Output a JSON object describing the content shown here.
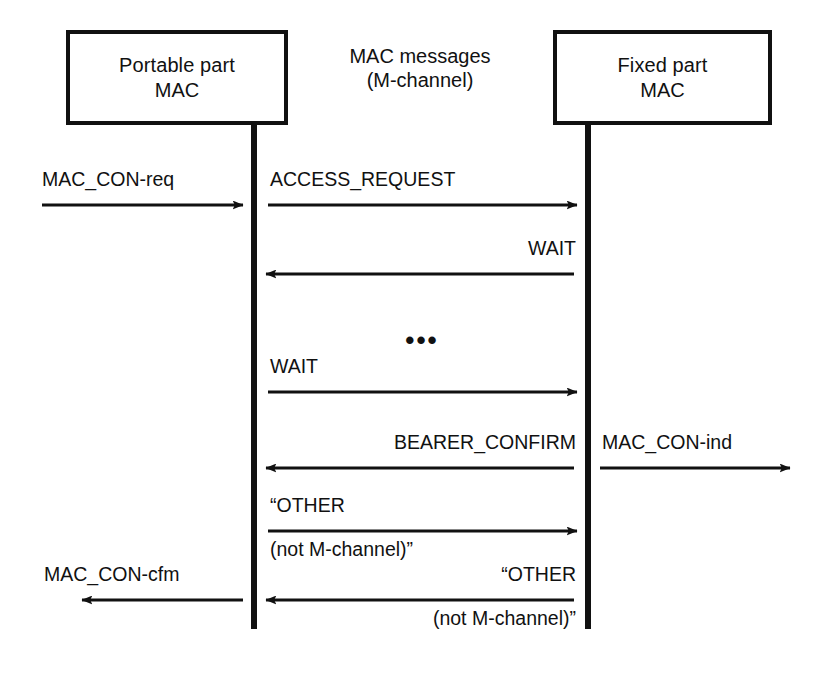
{
  "diagram": {
    "background_color": "#ffffff",
    "ink_color": "#111111"
  },
  "entities": {
    "left": {
      "line1": "Portable part",
      "line2": "MAC"
    },
    "right": {
      "line1": "Fixed part",
      "line2": "MAC"
    },
    "center_header": {
      "line1": "MAC messages",
      "line2": "(M-channel)"
    }
  },
  "messages": [
    {
      "id": "mac-con-req",
      "label": "MAC_CON-req",
      "direction": "right",
      "scope": "external-left"
    },
    {
      "id": "access-request",
      "label": "ACCESS_REQUEST",
      "direction": "right",
      "scope": "internal"
    },
    {
      "id": "wait-down",
      "label": "WAIT",
      "direction": "left",
      "scope": "internal"
    },
    {
      "id": "ellipsis",
      "label": "•••",
      "direction": "none",
      "scope": "internal"
    },
    {
      "id": "wait-up",
      "label": "WAIT",
      "direction": "right",
      "scope": "internal"
    },
    {
      "id": "bearer-confirm",
      "label": "BEARER_CONFIRM",
      "direction": "left",
      "scope": "internal"
    },
    {
      "id": "mac-con-ind",
      "label": "MAC_CON-ind",
      "direction": "right",
      "scope": "external-right"
    },
    {
      "id": "other-forward",
      "label_above": "“OTHER",
      "label_below": "(not M-channel)”",
      "direction": "right",
      "scope": "internal"
    },
    {
      "id": "other-backward",
      "label_above": "“OTHER",
      "label_below": "(not M-channel)”",
      "direction": "left",
      "scope": "internal"
    },
    {
      "id": "mac-con-cfm",
      "label": "MAC_CON-cfm",
      "direction": "left",
      "scope": "external-left"
    }
  ]
}
